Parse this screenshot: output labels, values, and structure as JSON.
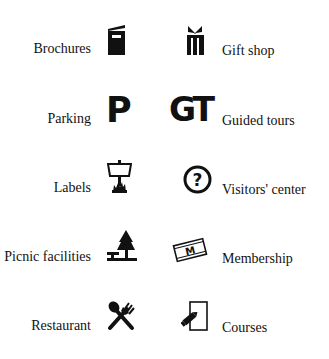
{
  "legend": {
    "left": [
      {
        "label": "Brochures",
        "icon": "brochure-icon"
      },
      {
        "label": "Parking",
        "icon": "parking-p-icon"
      },
      {
        "label": "Labels",
        "icon": "signpost-label-icon"
      },
      {
        "label": "Picnic facilities",
        "icon": "picnic-table-tree-icon"
      },
      {
        "label": "Restaurant",
        "icon": "fork-spoon-icon"
      }
    ],
    "right": [
      {
        "label": "Gift shop",
        "icon": "gift-icon"
      },
      {
        "label": "Guided tours",
        "icon": "guided-tours-gt-icon",
        "glyph": "GT"
      },
      {
        "label": "Visitors' center",
        "icon": "question-circle-icon",
        "glyph": "?"
      },
      {
        "label": "Membership",
        "icon": "membership-card-icon",
        "glyph": "M"
      },
      {
        "label": "Courses",
        "icon": "courses-pencil-paper-icon"
      }
    ],
    "parking_glyph": "P",
    "colors": {
      "ink": "#111111",
      "background": "#ffffff"
    }
  }
}
